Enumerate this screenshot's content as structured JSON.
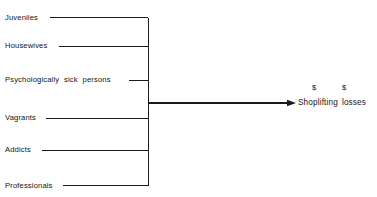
{
  "diagram": {
    "type": "convergence-fishbone",
    "background_color": "#ffffff",
    "line_color": "#1a1a1a",
    "spine": {
      "x": 148,
      "y_top": 17.5,
      "y_bottom": 185.5,
      "stroke_width": 1
    },
    "inputs": [
      {
        "label": "Juveniles",
        "label_x": 5,
        "line_start_x": 50,
        "y": 17.5,
        "wide_spacing": false
      },
      {
        "label": "Housewives",
        "label_x": 5,
        "line_start_x": 59,
        "y": 46,
        "wide_spacing": false
      },
      {
        "label": "Psychologically sick persons",
        "label_x": 5,
        "line_start_x": 129,
        "y": 80,
        "wide_spacing": true
      },
      {
        "label": "Vagrants",
        "label_x": 5,
        "line_start_x": 46,
        "y": 118,
        "wide_spacing": false
      },
      {
        "label": "Addicts",
        "label_x": 5,
        "line_start_x": 42,
        "y": 150,
        "wide_spacing": false
      },
      {
        "label": "Professionals",
        "label_x": 5,
        "line_start_x": 63,
        "y": 185.5,
        "wide_spacing": false
      }
    ],
    "output": {
      "arrow": {
        "x_start": 148,
        "x_end": 296,
        "y": 103,
        "stroke_width": 1.8
      },
      "label": "Shoplifting losses",
      "label_x": 298,
      "label_y": 103,
      "currency_symbols": [
        {
          "symbol": "$",
          "x": 314,
          "y": 88
        },
        {
          "symbol": "$",
          "x": 344,
          "y": 88
        }
      ]
    }
  }
}
